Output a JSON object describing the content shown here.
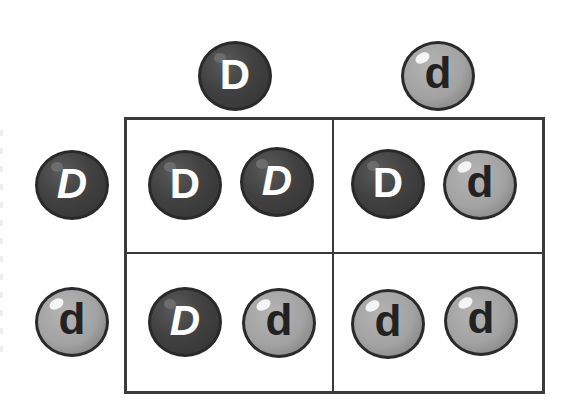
{
  "diagram": {
    "type": "punnett-square",
    "colors": {
      "dominant_ball": "#3d3d3d",
      "recessive_ball": "#a5a5a5",
      "grid_line": "#3a3a3a",
      "dominant_letter": "#ffffff",
      "recessive_letter": "#222222"
    },
    "top_alleles": [
      {
        "letter": "D",
        "kind": "dominant",
        "italic": false
      },
      {
        "letter": "d",
        "kind": "recessive",
        "italic": false
      }
    ],
    "left_alleles": [
      {
        "letter": "D",
        "kind": "dominant",
        "italic": true
      },
      {
        "letter": "d",
        "kind": "recessive",
        "italic": false
      }
    ],
    "cells": [
      {
        "row": 0,
        "col": 0,
        "genotype": "DD",
        "alleles": [
          {
            "letter": "D",
            "kind": "dominant",
            "italic": false
          },
          {
            "letter": "D",
            "kind": "dominant",
            "italic": true
          }
        ]
      },
      {
        "row": 0,
        "col": 1,
        "genotype": "Dd",
        "alleles": [
          {
            "letter": "D",
            "kind": "dominant",
            "italic": false
          },
          {
            "letter": "d",
            "kind": "recessive",
            "italic": false
          }
        ]
      },
      {
        "row": 1,
        "col": 0,
        "genotype": "Dd",
        "alleles": [
          {
            "letter": "D",
            "kind": "dominant",
            "italic": true
          },
          {
            "letter": "d",
            "kind": "recessive",
            "italic": false
          }
        ]
      },
      {
        "row": 1,
        "col": 1,
        "genotype": "dd",
        "alleles": [
          {
            "letter": "d",
            "kind": "recessive",
            "italic": false
          },
          {
            "letter": "d",
            "kind": "recessive",
            "italic": false
          }
        ]
      }
    ]
  }
}
